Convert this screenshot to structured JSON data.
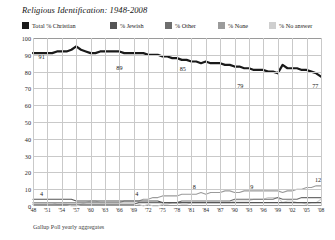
{
  "title": "Religious Identification: 1948-2008",
  "footer": "Gallup Poll yearly aggregates",
  "legend": [
    {
      "label": "Total % Christian",
      "color": "#1a1a1a",
      "left": 0
    },
    {
      "label": "% Jewish",
      "color": "#555555",
      "left": 88
    },
    {
      "label": "% Other",
      "color": "#6e6e6e",
      "left": 143
    },
    {
      "label": "% None",
      "color": "#9b9b9b",
      "left": 196
    },
    {
      "label": "% No answer",
      "color": "#cfcfcf",
      "left": 247
    }
  ],
  "annotations": [
    {
      "text": "91",
      "x": 3,
      "y": 89
    },
    {
      "text": "89",
      "x": 30,
      "y": 83
    },
    {
      "text": "85",
      "x": 52,
      "y": 82
    },
    {
      "text": "79",
      "x": 72,
      "y": 72
    },
    {
      "text": "77",
      "x": 98,
      "y": 72
    },
    {
      "text": "4",
      "x": 3,
      "y": 8
    },
    {
      "text": "4",
      "x": 36,
      "y": 8
    },
    {
      "text": "8",
      "x": 56,
      "y": 12
    },
    {
      "text": "9",
      "x": 76,
      "y": 12
    },
    {
      "text": "12",
      "x": 99,
      "y": 16
    }
  ],
  "chart_data": {
    "type": "line",
    "title": "Religious Identification: 1948-2008",
    "subtitle": "",
    "xlabel": "",
    "ylabel": "",
    "source": "Gallup Poll yearly aggregates",
    "ylim": [
      0,
      100
    ],
    "ytick_step": 10,
    "yticks": [
      0,
      10,
      20,
      30,
      40,
      50,
      60,
      70,
      80,
      90,
      100
    ],
    "xlim": [
      1948,
      2008
    ],
    "grid": true,
    "legend_position": "top",
    "xticks": [
      "'48",
      "'51",
      "'54",
      "'57",
      "'60",
      "'63",
      "'66",
      "'69",
      "'72",
      "'75",
      "'78",
      "'81",
      "'84",
      "'87",
      "'90",
      "'93",
      "'96",
      "'99",
      "'02",
      "'05",
      "'08"
    ],
    "x": [
      1948,
      1949,
      1950,
      1951,
      1952,
      1953,
      1954,
      1955,
      1956,
      1957,
      1958,
      1959,
      1960,
      1961,
      1962,
      1963,
      1964,
      1965,
      1966,
      1967,
      1968,
      1969,
      1970,
      1971,
      1972,
      1973,
      1974,
      1975,
      1976,
      1977,
      1978,
      1979,
      1980,
      1981,
      1982,
      1983,
      1984,
      1985,
      1986,
      1987,
      1988,
      1989,
      1990,
      1991,
      1992,
      1993,
      1994,
      1995,
      1996,
      1997,
      1998,
      1999,
      2000,
      2001,
      2002,
      2003,
      2004,
      2005,
      2006,
      2007,
      2008
    ],
    "series": [
      {
        "name": "Total % Christian",
        "color": "#1a1a1a",
        "values": [
          91,
          91,
          91,
          91,
          91,
          92,
          92,
          92,
          93,
          95,
          93,
          92,
          91,
          91,
          92,
          92,
          92,
          92,
          92,
          91,
          91,
          91,
          91,
          91,
          90,
          90,
          90,
          89,
          89,
          88,
          88,
          87,
          87,
          86,
          86,
          85,
          86,
          85,
          85,
          85,
          84,
          84,
          83,
          83,
          82,
          82,
          81,
          81,
          81,
          80,
          80,
          79,
          84,
          82,
          82,
          82,
          81,
          81,
          80,
          79,
          77
        ]
      },
      {
        "name": "% Jewish",
        "color": "#555555",
        "values": [
          4,
          4,
          4,
          4,
          4,
          4,
          4,
          4,
          4,
          3,
          3,
          3,
          3,
          3,
          3,
          3,
          3,
          3,
          3,
          3,
          3,
          3,
          3,
          3,
          3,
          3,
          3,
          2,
          2,
          2,
          2,
          2,
          2,
          2,
          2,
          2,
          2,
          2,
          2,
          2,
          2,
          2,
          2,
          2,
          2,
          2,
          2,
          2,
          2,
          2,
          2,
          2,
          2,
          2,
          2,
          2,
          2,
          2,
          2,
          2,
          2
        ]
      },
      {
        "name": "% Other",
        "color": "#6e6e6e",
        "values": [
          1,
          1,
          1,
          1,
          1,
          1,
          1,
          1,
          1,
          1,
          1,
          1,
          1,
          1,
          1,
          1,
          1,
          1,
          1,
          1,
          1,
          1,
          2,
          2,
          2,
          2,
          2,
          2,
          2,
          2,
          2,
          3,
          3,
          3,
          3,
          3,
          3,
          3,
          3,
          3,
          3,
          3,
          4,
          4,
          4,
          4,
          4,
          4,
          4,
          4,
          4,
          5,
          4,
          4,
          4,
          4,
          5,
          5,
          5,
          5,
          5
        ]
      },
      {
        "name": "% None",
        "color": "#9b9b9b",
        "values": [
          2,
          2,
          2,
          2,
          2,
          2,
          2,
          2,
          2,
          2,
          2,
          2,
          2,
          2,
          2,
          2,
          2,
          2,
          2,
          3,
          3,
          3,
          3,
          4,
          4,
          5,
          5,
          6,
          6,
          6,
          6,
          7,
          7,
          7,
          7,
          8,
          7,
          8,
          8,
          8,
          9,
          9,
          8,
          8,
          9,
          9,
          9,
          9,
          9,
          9,
          9,
          9,
          8,
          9,
          9,
          10,
          10,
          11,
          11,
          12,
          12
        ]
      },
      {
        "name": "% No answer",
        "color": "#cfcfcf",
        "values": [
          2,
          2,
          2,
          2,
          2,
          1,
          1,
          1,
          0,
          0,
          1,
          2,
          3,
          3,
          2,
          2,
          2,
          2,
          2,
          2,
          2,
          2,
          1,
          0,
          1,
          0,
          0,
          1,
          1,
          2,
          2,
          1,
          1,
          2,
          2,
          2,
          2,
          2,
          2,
          2,
          2,
          2,
          3,
          3,
          3,
          3,
          4,
          4,
          4,
          5,
          5,
          5,
          2,
          3,
          3,
          2,
          2,
          1,
          2,
          2,
          4
        ]
      }
    ]
  }
}
